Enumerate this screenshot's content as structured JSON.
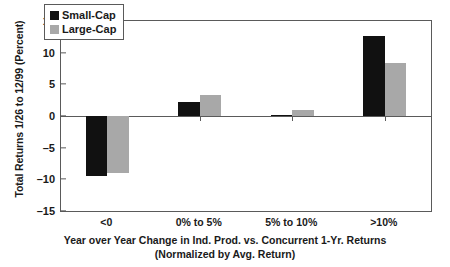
{
  "chart_data": {
    "type": "bar",
    "title": "",
    "categories": [
      "<0",
      "0% to 5%",
      "5% to 10%",
      ">10%"
    ],
    "series": [
      {
        "name": "Small-Cap",
        "color": "#111111",
        "values": [
          -9.4,
          2.2,
          0.15,
          12.7
        ]
      },
      {
        "name": "Large-Cap",
        "color": "#a8a8a8",
        "values": [
          -9.0,
          3.3,
          0.9,
          8.4
        ]
      }
    ],
    "ylabel": "Total Returns 1/26 to 12/99 (Percent)",
    "xlabel": "Year over Year Change in Ind. Prod. vs. Concurrent 1-Yr. Returns",
    "xlabel_line2": "(Normalized by Avg. Return)",
    "ylim": [
      -15,
      15
    ],
    "yticks": [
      15,
      10,
      5,
      0,
      -5,
      -10,
      -15
    ],
    "ytick_labels": [
      "15",
      "10",
      "5",
      "0",
      "–5",
      "–10",
      "–15"
    ],
    "grid": false,
    "legend_position": "top-left-inside"
  },
  "axes": {
    "y_title": "Total Returns 1/26 to 12/99 (Percent)",
    "x_title_line1": "Year over Year Change in Ind. Prod. vs. Concurrent 1-Yr. Returns",
    "x_title_line2": "(Normalized by Avg. Return)"
  },
  "legend": {
    "items": [
      {
        "label": "Small-Cap",
        "swatch": "black-square-swatch"
      },
      {
        "label": "Large-Cap",
        "swatch": "gray-square-swatch"
      }
    ]
  }
}
